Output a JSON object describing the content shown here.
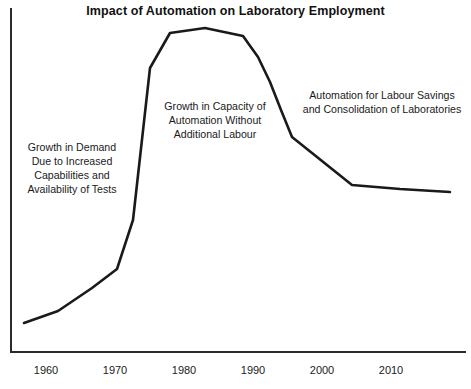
{
  "chart_data": {
    "type": "line",
    "title": "Impact of Automation on Laboratory Employment",
    "xlabel": "",
    "ylabel": "",
    "grid": false,
    "legend": "none",
    "axes_style": "L-shaped spine (left and bottom only), no tick marks, no y-axis labels",
    "xlim": [
      1955,
      2015
    ],
    "ylim": [
      0,
      100
    ],
    "xticks": [
      "1960",
      "1970",
      "1980",
      "1990",
      "2000",
      "2010"
    ],
    "yticks": [],
    "series": [
      {
        "name": "Laboratory Employment",
        "x": [
          1957.0,
          1962.0,
          1967.0,
          1970.5,
          1972.5,
          1974.5,
          1976.0,
          1978.0,
          1983.5,
          1988.5,
          1991.0,
          1993.5,
          1995.5,
          2000.0,
          2004.5,
          2010.0,
          2014.0
        ],
        "values": [
          8,
          13,
          21,
          27,
          33,
          38,
          52,
          90,
          95,
          92,
          88,
          75,
          62,
          60,
          47,
          45,
          44
        ],
        "points_px": [
          [
            24,
            323
          ],
          [
            58,
            311
          ],
          [
            92,
            288
          ],
          [
            117,
            269
          ],
          [
            133,
            220
          ],
          [
            150,
            68
          ],
          [
            170,
            33
          ],
          [
            205,
            28
          ],
          [
            243,
            36
          ],
          [
            258,
            57
          ],
          [
            270,
            82
          ],
          [
            281,
            110
          ],
          [
            292,
            137
          ],
          [
            322,
            161
          ],
          [
            352,
            185
          ],
          [
            400,
            189
          ],
          [
            450,
            192
          ]
        ],
        "color": "#1a1a1a",
        "linewidth": 2.6
      }
    ],
    "annotations": [
      {
        "id": "growth-in-demand",
        "text": "Growth in Demand\nDue to Increased\nCapabilities and\nAvailability of Tests",
        "region": "left rising limb, 1960s-1970s"
      },
      {
        "id": "growth-in-capacity",
        "text": "Growth in Capacity of\nAutomation Without\nAdditional Labour",
        "region": "under the plateau, 1975-1990"
      },
      {
        "id": "automation-labour-savings",
        "text": "Automation for Labour Savings\nand Consolidation of Laboratories",
        "region": "right declining limb, 1990-2015"
      }
    ]
  },
  "figure": {
    "title": "Impact of Automation on Laboratory Employment",
    "background_color": "#ffffff",
    "axis_color": "#2b2b2b",
    "line_color": "#1a1a1a",
    "text_color": "#1a1a1a"
  },
  "annotations": {
    "demand": "Growth in Demand\nDue to Increased\nCapabilities and\nAvailability of Tests",
    "capacity": "Growth in Capacity of\nAutomation Without\nAdditional Labour",
    "savings": "Automation for Labour Savings\nand Consolidation of Laboratories"
  },
  "xaxis": {
    "labels": [
      {
        "text": "1960",
        "x_px": 46
      },
      {
        "text": "1970",
        "x_px": 115
      },
      {
        "text": "1980",
        "x_px": 184
      },
      {
        "text": "1990",
        "x_px": 253
      },
      {
        "text": "2000",
        "x_px": 322
      },
      {
        "text": "2010",
        "x_px": 391
      }
    ]
  }
}
